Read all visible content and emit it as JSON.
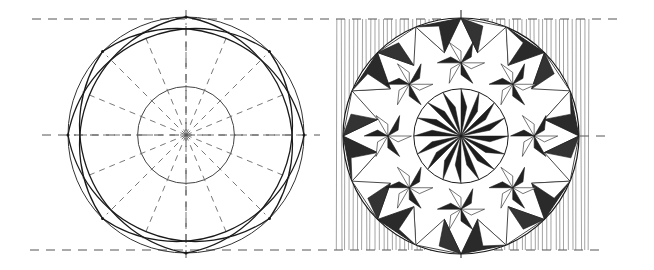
{
  "figure": {
    "title": "Rosette chip-carving construction and finished pattern",
    "panels": [
      {
        "name": "construction",
        "description": "Compass construction of an 8-point rosette with dashed guide lines"
      },
      {
        "name": "carved-pattern",
        "description": "Finished chip-carved rosette with hatched shading and background hatching"
      }
    ]
  },
  "colors": {
    "ink": "#1a1a1a",
    "guide": "#555555",
    "paper": "#ffffff"
  },
  "geometry": {
    "left_center": [
      186,
      135
    ],
    "right_center": [
      461,
      136
    ],
    "radius": 118,
    "top_guide_y": 19,
    "bottom_guide_y": 250,
    "hatch_box": [
      337,
      19,
      590,
      250
    ]
  }
}
